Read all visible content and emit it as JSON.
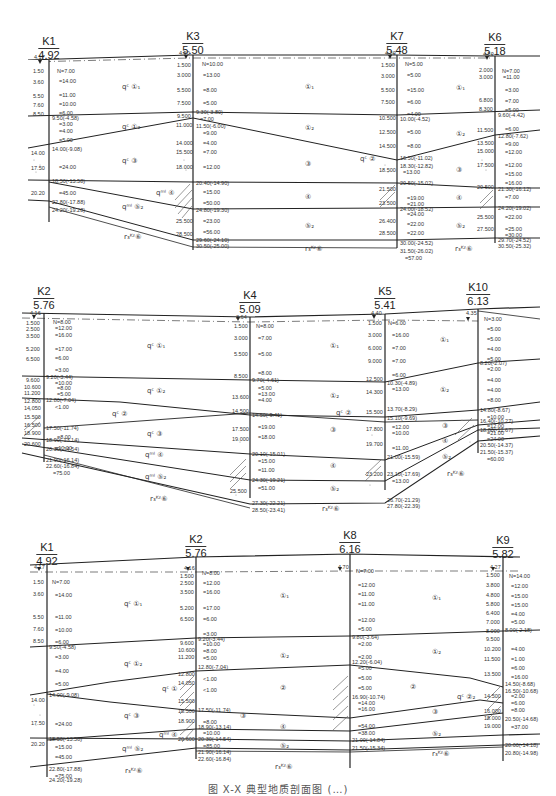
{
  "document": {
    "type": "engineering geological cross-section sheet",
    "caption": "图 X-X 典型地质剖面图 (…)"
  },
  "profiles": [
    {
      "name": "profile-1",
      "boreholes": [
        {
          "id": "K1",
          "elev": "4.92",
          "water": "4.17",
          "depths": [
            "1.50",
            "3.60",
            "5.50",
            "7.60",
            "8.50",
            "14.00",
            "17.50",
            "20.20"
          ],
          "n_values": [
            "N=7.00",
            "=14.00",
            "=11.00",
            "=10.00",
            "=6.00",
            "=3.00",
            "=4.00",
            "=5.00",
            "=24.00",
            "=45.00"
          ],
          "boundaries": [
            "9.50(-4.58)",
            "14.00(-9.08)",
            "18.50(-13.58)",
            "22.80(-17.88)",
            "24.20(-19.28)"
          ]
        },
        {
          "id": "K3",
          "elev": "5.50",
          "water": "4.50",
          "depths": [
            "1.500",
            "3.000",
            "5.500",
            "7.500",
            "9.500",
            "11.000",
            "14.000",
            "15.500",
            "18.000",
            "25.500",
            "28.500"
          ],
          "n_values": [
            "N=10.00",
            "=13.00",
            "=8.00",
            "=5.00",
            "=7.00",
            "=10.00",
            "=9.00",
            "=4.00",
            "=7.00",
            "=12.00",
            "=12.00",
            "=15.00",
            "=50.00",
            "=23.00",
            "=56.00"
          ],
          "boundaries": [
            "9.30(-3.80)",
            "11.50(-6.00)",
            "20.40(-14.90)",
            "24.80(-19.30)",
            "29.60(-24.10)",
            "30.50(-25.00)"
          ]
        },
        {
          "id": "K7",
          "elev": "5.48",
          "water": "4.30",
          "depths": [
            "1.500",
            "3.000",
            "5.500",
            "7.500",
            "10.500",
            "12.500",
            "14.500",
            "18.500",
            "21.500",
            "23.500",
            "26.400",
            "28.500"
          ],
          "n_values": [
            "N=5.00",
            "=5.00",
            "=15.00",
            "=6.00",
            "=4.00",
            "=5.00",
            "=8.00",
            "=13.00",
            "=14.00",
            "=13.00",
            "=19.00",
            "=21.00",
            "=24.00",
            "=22.00",
            "=22.00",
            "=57.00"
          ],
          "boundaries": [
            "10.00(-4.52)",
            "16.50(-11.02)",
            "18.30(-12.82)",
            "20.50(-15.02)",
            "24.00(-18.52)",
            "30.00(-24.52)",
            "31.50(-26.02)"
          ]
        },
        {
          "id": "K6",
          "elev": "5.18",
          "water": "4.50",
          "depths": [
            "2.000",
            "3.000",
            "6.800",
            "8.300",
            "11.500",
            "13.500",
            "15.000",
            "17.500",
            "20.500",
            "25.500",
            "27.500"
          ],
          "n_values": [
            "N=7.00",
            "=11.00",
            "=3.00",
            "=7.00",
            "=5.00",
            "=6.00",
            "=9.00",
            "=12.00",
            "=12.00",
            "=15.00",
            "=16.00",
            "=7.00",
            "=22.00",
            "=25.00",
            "=30.00"
          ],
          "boundaries": [
            "9.60(-4.42)",
            "12.80(-7.62)",
            "21.30(-16.12)",
            "24.20(-19.02)",
            "29.70(-24.52)",
            "30.50(-25.32)"
          ]
        }
      ],
      "layers": [
        "qᶜ ①₁",
        "qᶜ ①₂",
        "qᶜ ③",
        "qᵐˡ ④",
        "qᵐˡ ⑤₂",
        "r₃ᴷᶻ⑥",
        "①₁",
        "①₂",
        "③",
        "④",
        "⑤₂",
        "①₁",
        "①₂",
        "③",
        "④",
        "⑤₂",
        "r₃ᴷᶻ⑥",
        "r₃ᴷᶻ⑥",
        "qᶜ ②"
      ]
    },
    {
      "name": "profile-2",
      "boreholes": [
        {
          "id": "K2",
          "elev": "5.76",
          "water": "4.16",
          "depths": [
            "1.500",
            "2.500",
            "3.500",
            "5.200",
            "6.500",
            "9.600",
            "10.600",
            "11.200",
            "12.800",
            "14.050",
            "15.500",
            "16.500",
            "18.900",
            "20.600"
          ],
          "n_values": [
            "N=8.00",
            "=12.00",
            "=16.00",
            "=17.00",
            "=6.00",
            "=3.00",
            "=10.00",
            "=8.00",
            "=5.00",
            "<1.00",
            "=8.00",
            "=10.00",
            "=85.00",
            "=75.00"
          ],
          "boundaries": [
            "9.20(-3.44)",
            "12.80(-7.04)",
            "17.50(-11.74)",
            "18.90(-13.14)",
            "20.30(-14.54)",
            "21.90(-16.14)",
            "22.60(-16.84)"
          ]
        },
        {
          "id": "K4",
          "elev": "5.09",
          "water": "3.64",
          "depths": [
            "1.500",
            "3.000",
            "5.500",
            "8.500",
            "13.600",
            "14.500",
            "17.500",
            "19.000",
            "25.500"
          ],
          "n_values": [
            "N=8.00",
            "=7.00",
            "=5.00",
            "=8.00",
            "=5.00",
            "=13.00",
            "=4.00",
            "=19.00",
            "=18.00",
            "=15.00",
            "=11.00",
            "=51.00"
          ],
          "boundaries": [
            "9.70(-4.61)",
            "14.50(-9.41)",
            "20.10(-15.01)",
            "24.30(-19.21)",
            "27.30(-22.21)",
            "28.50(-23.41)"
          ]
        },
        {
          "id": "K5",
          "elev": "5.41",
          "water": "4.40",
          "depths": [
            "1.500",
            "3.000",
            "6.000",
            "9.000",
            "12.500",
            "14.300",
            "15.500",
            "17.800",
            "19.700",
            "23.200"
          ],
          "n_values": [
            "N=6.00",
            "=16.00",
            "=7.00",
            "=7.00",
            "=6.00",
            "=13.00",
            "=12.00",
            "=10.00",
            "=11.00",
            "=13.00"
          ],
          "boundaries": [
            "10.30(-4.89)",
            "13.70(-8.29)",
            "15.10(-9.69)",
            "21.00(-15.59)",
            "23.10(-17.69)",
            "26.70(-21.29)",
            "27.80(-22.39)"
          ]
        },
        {
          "id": "K10",
          "elev": "6.13",
          "water": "4.35",
          "depths": [],
          "n_values": [
            "N=3.00",
            "=5.00",
            "=5.00",
            "=4.00",
            "=5.00",
            "=2.00",
            "=4.00",
            "=4.00",
            "=8.00",
            "=10.00",
            "=12.00",
            "=21.00",
            "=24.00",
            "=60.00"
          ],
          "boundaries": [
            "8.20(-2.07)",
            "14.80(-8.67)",
            "16.40(-10.27)",
            "18.80(-12.67)",
            "20.50(-14.37)",
            "21.50(-15.37)"
          ]
        }
      ],
      "layers": [
        "qᶜ ①₁",
        "qᶜ ①₂",
        "qᶜ ②",
        "qᶜ ③",
        "qᵐˡ ④",
        "qᵐˡ ⑤₂",
        "r₃ᴷᶻ⑥",
        "①₁",
        "①₂",
        "③",
        "④",
        "⑤₂",
        "r₃ᴷᶻ⑥",
        "qᶜ ②",
        "①₁",
        "①₂",
        "③",
        "④",
        "⑤₂",
        "r₃ᴷᶻ⑥"
      ]
    },
    {
      "name": "profile-3",
      "boreholes": [
        {
          "id": "K1",
          "elev": "4.92",
          "water": "4.17",
          "depths": [
            "1.50",
            "3.60",
            "5.50",
            "7.60",
            "8.50",
            "14.00",
            "17.50",
            "20.20"
          ],
          "n_values": [
            "N=7.00",
            "=14.00",
            "=11.00",
            "=10.00",
            "=6.00",
            "=3.00",
            "=4.00",
            "=5.00",
            "=24.00",
            "=15.00",
            "=45.00",
            "=75.00"
          ],
          "boundaries": [
            "9.50(-4.58)",
            "14.00(-9.08)",
            "18.50(-13.58)",
            "22.80(-17.88)",
            "24.20(-19.28)"
          ]
        },
        {
          "id": "K2",
          "elev": "5.76",
          "water": "4.16",
          "depths": [
            "1.500",
            "2.500",
            "3.500",
            "5.200",
            "6.500",
            "9.600",
            "10.600",
            "11.200",
            "12.800",
            "14.050",
            "15.500",
            "16.500",
            "18.900",
            "20.600"
          ],
          "n_values": [
            "N=8.00",
            "=12.00",
            "=16.00",
            "=17.00",
            "=6.00",
            "=3.00",
            "=10.00",
            "=8.00",
            "=5.00",
            "<1.00",
            "<1.00",
            "=8.00",
            "=10.00",
            "=85.00"
          ],
          "boundaries": [
            "9.20(-3.44)",
            "12.80(-7.04)",
            "17.50(-11.74)",
            "18.90(-13.14)",
            "20.30(-14.54)",
            "21.90(-16.14)",
            "22.60(-16.84)"
          ]
        },
        {
          "id": "K8",
          "elev": "6.16",
          "water": "4.70",
          "depths": [],
          "n_values": [
            "N=7.00",
            "=12.00",
            "=11.00",
            "=11.00",
            "=12.00",
            "=5.00",
            "=2.00",
            "=2.00",
            "=5.00",
            "=5.00",
            "=5.00",
            "=14.00",
            "=16.00",
            "=54.00",
            "=38.00"
          ],
          "boundaries": [
            "9.80(-3.64)",
            "12.20(-6.04)",
            "16.90(-10.74)",
            "21.00(-14.84)",
            "21.50(-15.34)"
          ]
        },
        {
          "id": "K9",
          "elev": "5.82",
          "water": "4.27",
          "depths": [
            "1.500",
            "3.800",
            "4.800",
            "5.800",
            "6.400",
            "7.000",
            "8.000",
            "9.500",
            "10.200",
            "11.500",
            "13.500",
            "14.500",
            "16.000",
            "18.000",
            "19.000"
          ],
          "n_values": [
            "N=14.00",
            "=12.00",
            "=15.00",
            "=15.00",
            "=4.00",
            "=5.00",
            "=5.00",
            "=4.00",
            "=1.00",
            "=6.00",
            "=16.00",
            "=2.00",
            "=6.00",
            "=8.00",
            "=37.00"
          ],
          "boundaries": [
            "8.00(-2.18)",
            "14.50(-8.68)",
            "16.50(-10.68)",
            "20.50(-14.68)",
            "20.00(-14.18)",
            "20.80(-14.98)"
          ]
        }
      ],
      "layers": [
        "qᶜ ①₁",
        "qᶜ ①₂",
        "qᶜ ①",
        "qᶜ ③",
        "qᵐˡ ④",
        "qᵐˡ ⑤₂",
        "r₃ᴷᶻ⑥",
        "①₁",
        "①₂",
        "②",
        "③",
        "④",
        "⑤₂",
        "r₃ᴷᶻ⑥",
        "①₁",
        "①₂",
        "②",
        "③",
        "⑤₂",
        "r₃ᴷᶻ⑥",
        "qᶜ ②₂"
      ]
    }
  ]
}
